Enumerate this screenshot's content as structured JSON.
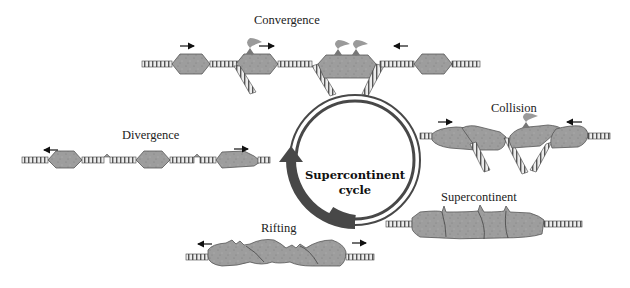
{
  "diagram": {
    "title": "Supercontinent cycle",
    "center_label": {
      "line1": "Supercontinent",
      "line2": "cycle"
    },
    "stages": [
      {
        "id": "convergence",
        "label": "Convergence"
      },
      {
        "id": "collision",
        "label": "Collision"
      },
      {
        "id": "supercontinent",
        "label": "Supercontinent"
      },
      {
        "id": "rifting",
        "label": "Rifting"
      },
      {
        "id": "divergence",
        "label": "Divergence"
      }
    ],
    "cycle_direction": "clockwise",
    "colors": {
      "continent_fill": "#9a9a9a",
      "continent_stroke": "#555555",
      "ring": "#4a4a4a",
      "oceanic_plate": "#bdbdbd",
      "volcano": "#8e8e8e"
    }
  }
}
